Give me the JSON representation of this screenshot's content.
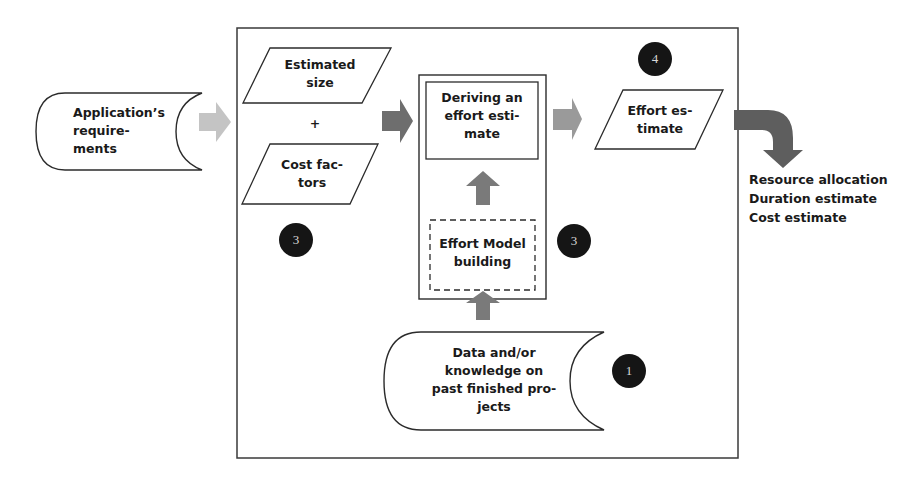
{
  "diagram": {
    "nodes": {
      "app_requirements": {
        "label": "Application’s\nrequire-\nments",
        "shape": "stored-data"
      },
      "estimated_size": {
        "label": "Estimated\nsize",
        "shape": "parallelogram"
      },
      "plus": {
        "label": "+"
      },
      "cost_factors": {
        "label": "Cost fac-\ntors",
        "shape": "parallelogram"
      },
      "deriving_estimate": {
        "label": "Deriving an\neffort esti-\nmate",
        "shape": "rectangle"
      },
      "effort_model": {
        "label": "Effort Model\nbuilding",
        "shape": "dashed-rectangle"
      },
      "past_data": {
        "label": "Data and/or\nknowledge on\npast finished pro-\njects",
        "shape": "stored-data"
      },
      "effort_estimate": {
        "label": "Effort es-\ntimate",
        "shape": "parallelogram"
      }
    },
    "badges": [
      "1",
      "2",
      "3",
      "4"
    ],
    "outputs": [
      "Resource allocation",
      "Duration estimate",
      "Cost estimate"
    ],
    "colors": {
      "stroke": "#2b2b2b",
      "arrow_light": "#c4c4c4",
      "arrow_mid": "#9a9a9a",
      "arrow_dark": "#6e6e6e",
      "badge": "#151515"
    }
  }
}
